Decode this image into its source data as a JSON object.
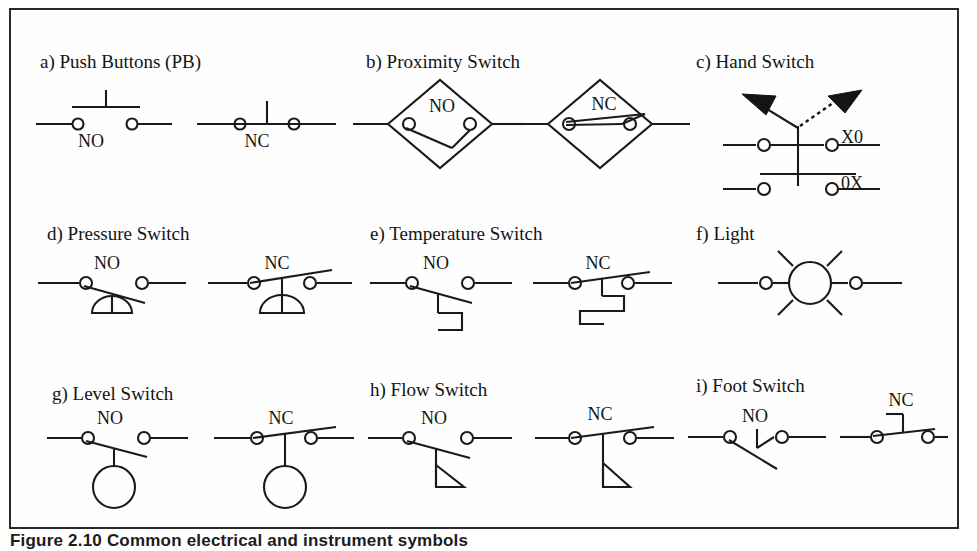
{
  "figure": {
    "caption": "Figure 2.10  Common electrical and instrument symbols",
    "border_color": "#2a2a2a",
    "line_color": "#1a1a1a",
    "background": "#ffffff"
  },
  "groups": [
    {
      "key": "push-buttons",
      "letter_label": "a) Push Buttons (PB)",
      "symbols": [
        {
          "key": "pb-no",
          "label": "NO",
          "type": "push-button-normally-open"
        },
        {
          "key": "pb-nc",
          "label": "NC",
          "type": "push-button-normally-closed"
        }
      ]
    },
    {
      "key": "proximity-switch",
      "letter_label": "b) Proximity Switch",
      "symbols": [
        {
          "key": "prox-no",
          "label": "NO",
          "type": "proximity-normally-open"
        },
        {
          "key": "prox-nc",
          "label": "NC",
          "type": "proximity-normally-closed"
        }
      ]
    },
    {
      "key": "hand-switch",
      "letter_label": "c) Hand Switch",
      "symbols": [
        {
          "key": "hs-x0",
          "label": "X0",
          "type": "hand-switch-position-upper"
        },
        {
          "key": "hs-0x",
          "label": "0X",
          "type": "hand-switch-position-lower"
        }
      ]
    },
    {
      "key": "pressure-switch",
      "letter_label": "d) Pressure Switch",
      "symbols": [
        {
          "key": "ps-no",
          "label": "NO",
          "type": "pressure-normally-open"
        },
        {
          "key": "ps-nc",
          "label": "NC",
          "type": "pressure-normally-closed"
        }
      ]
    },
    {
      "key": "temperature-switch",
      "letter_label": "e) Temperature Switch",
      "symbols": [
        {
          "key": "ts-no",
          "label": "NO",
          "type": "temperature-normally-open"
        },
        {
          "key": "ts-nc",
          "label": "NC",
          "type": "temperature-normally-closed"
        }
      ]
    },
    {
      "key": "light",
      "letter_label": "f) Light",
      "symbols": [
        {
          "key": "light-lamp",
          "label": "",
          "type": "indicating-light"
        }
      ]
    },
    {
      "key": "level-switch",
      "letter_label": "g) Level Switch",
      "symbols": [
        {
          "key": "ls-no",
          "label": "NO",
          "type": "level-normally-open"
        },
        {
          "key": "ls-nc",
          "label": "NC",
          "type": "level-normally-closed"
        }
      ]
    },
    {
      "key": "flow-switch",
      "letter_label": "h) Flow Switch",
      "symbols": [
        {
          "key": "fs-no",
          "label": "NO",
          "type": "flow-normally-open"
        },
        {
          "key": "fs-nc",
          "label": "NC",
          "type": "flow-normally-closed"
        }
      ]
    },
    {
      "key": "foot-switch",
      "letter_label": "i) Foot Switch",
      "symbols": [
        {
          "key": "foot-no",
          "label": "NO",
          "type": "foot-normally-open"
        },
        {
          "key": "foot-nc",
          "label": "NC",
          "type": "foot-normally-closed"
        }
      ]
    }
  ]
}
